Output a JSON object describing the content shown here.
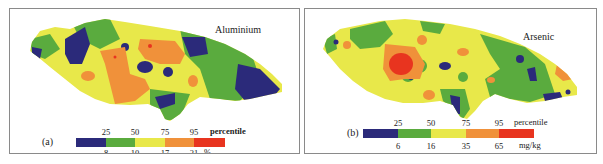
{
  "colors": {
    "c1": "#2b2a7a",
    "c2": "#5aab3e",
    "c3": "#e8e84a",
    "c4": "#f0913a",
    "c5": "#e8341f"
  },
  "panels": [
    {
      "label": "(a)",
      "title": "Aluminium",
      "legend": {
        "percentiles": [
          "25",
          "50",
          "75",
          "95"
        ],
        "percentile_label": "percentile",
        "values": [
          "8",
          "10",
          "17",
          "21"
        ],
        "unit": "%"
      }
    },
    {
      "label": "(b)",
      "title": "Arsenic",
      "legend": {
        "percentiles": [
          "25",
          "50",
          "75",
          "95"
        ],
        "percentile_label": "percentile",
        "values": [
          "6",
          "16",
          "35",
          "65"
        ],
        "unit": "mg/kg"
      }
    }
  ]
}
